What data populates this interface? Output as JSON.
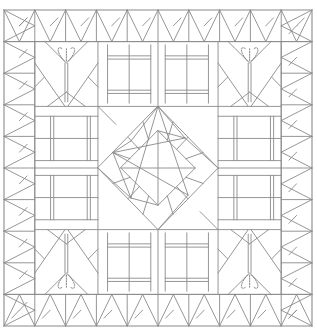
{
  "diagram": {
    "title": "",
    "kind": "quilt-pattern-line-art",
    "stroke_color": "#8a8a8a",
    "stroke_dark": "#555555",
    "dashed_color": "#777777",
    "background": "#ffffff",
    "frame": {
      "x0": 4,
      "y0": 10,
      "x1": 312,
      "y1": 326
    },
    "grid": {
      "cols": 10,
      "rows": 10
    },
    "layout": {
      "border_triangles": "half-square / flying-geese triangles around all four edges",
      "corner_blocks": [
        "top-left",
        "top-right",
        "bottom-left",
        "bottom-right"
      ],
      "corner_block_motif": "inverted triangle fan with dashed heart/fan petals on double-line stem",
      "side_blocks": [
        "top",
        "bottom",
        "left",
        "right"
      ],
      "side_block_motif": "two rail-fence rectangles with double bars",
      "center_block": "on-point square-in-a-square with pinwheel triangles"
    }
  }
}
